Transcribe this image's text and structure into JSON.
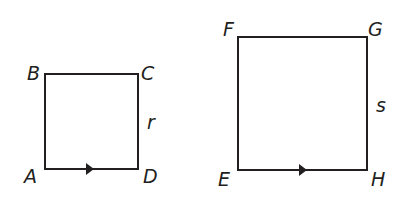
{
  "diagram": {
    "colors": {
      "stroke": "#231f20",
      "background": "#ffffff"
    },
    "small_square": {
      "vertices": {
        "A": "A",
        "B": "B",
        "C": "C",
        "D": "D"
      },
      "side_label": "r"
    },
    "large_square": {
      "vertices": {
        "E": "E",
        "F": "F",
        "G": "G",
        "H": "H"
      },
      "side_label": "s"
    }
  }
}
